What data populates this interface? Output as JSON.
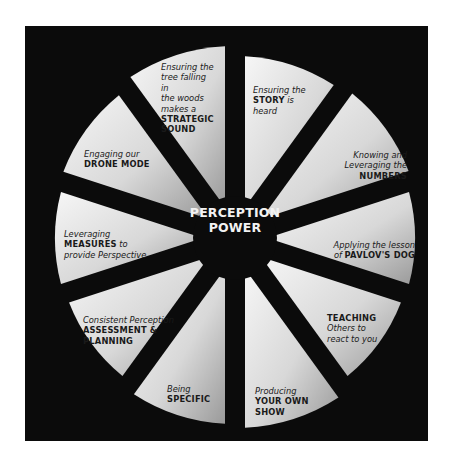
{
  "diagram": {
    "center": {
      "line1": "PERCEPTION",
      "line2": "POWER"
    },
    "colors": {
      "background": "#ffffff",
      "panel": "#0b0b0b",
      "wedge_light": "#f4f4f4",
      "wedge_dark": "#9e9e9e",
      "center_text": "#f2f2f2",
      "label_text": "#1a1a1a"
    },
    "wedges": [
      {
        "pre": "Ensuring the",
        "bold": "STORY",
        "post": "is heard"
      },
      {
        "pre": "Knowing and Leveraging the",
        "bold": "NUMBERS",
        "post": ""
      },
      {
        "pre": "Applying the lesson of",
        "bold": "PAVLOV'S DOG",
        "post": ""
      },
      {
        "pre": "",
        "bold": "TEACHING",
        "post": "Others to react to you"
      },
      {
        "pre": "Producing",
        "bold": "YOUR OWN SHOW",
        "post": ""
      },
      {
        "pre": "Being",
        "bold": "SPECIFIC",
        "post": ""
      },
      {
        "pre": "Consistent Perception",
        "bold": "ASSESSMENT & PLANNING",
        "post": ""
      },
      {
        "pre": "Leveraging",
        "bold": "MEASURES",
        "post": "to provide Perspective"
      },
      {
        "pre": "Engaging our",
        "bold": "DRONE MODE",
        "post": ""
      },
      {
        "pre": "Ensuring the tree falling in the woods makes a",
        "bold": "STRATEGIC SOUND",
        "post": ""
      }
    ]
  }
}
